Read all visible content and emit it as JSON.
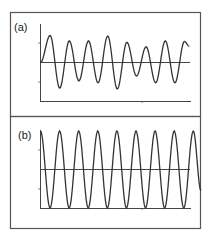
{
  "figure": {
    "panels": [
      {
        "id": "a",
        "label": "(a)"
      },
      {
        "id": "b",
        "label": "(b)"
      }
    ]
  },
  "chart_data": [
    {
      "type": "line",
      "title": "(a)",
      "xlabel": "",
      "ylabel": "",
      "grid": false,
      "description": "Oscillation with varying (modulated) amplitude about a center line",
      "extrema": [
        {
          "x": 0.0,
          "y": 0.0
        },
        {
          "x": 0.5,
          "y": 1.0
        },
        {
          "x": 1.0,
          "y": -0.95
        },
        {
          "x": 1.5,
          "y": 0.8
        },
        {
          "x": 2.0,
          "y": -0.68
        },
        {
          "x": 2.5,
          "y": 0.8
        },
        {
          "x": 3.0,
          "y": -0.75
        },
        {
          "x": 3.5,
          "y": 0.98
        },
        {
          "x": 4.0,
          "y": -0.98
        },
        {
          "x": 4.5,
          "y": 0.75
        },
        {
          "x": 5.0,
          "y": -0.5
        },
        {
          "x": 5.5,
          "y": 0.58
        },
        {
          "x": 6.0,
          "y": -0.75
        },
        {
          "x": 6.5,
          "y": 0.8
        },
        {
          "x": 7.0,
          "y": -0.75
        },
        {
          "x": 7.5,
          "y": 0.78
        },
        {
          "x": 7.75,
          "y": 0.6
        }
      ],
      "ylim": [
        -1.2,
        1.2
      ]
    },
    {
      "type": "line",
      "title": "(b)",
      "xlabel": "",
      "ylabel": "",
      "grid": false,
      "description": "Constant-amplitude sinusoidal oscillation",
      "extrema": [
        {
          "x": 0.0,
          "y": 1.0
        },
        {
          "x": 0.5,
          "y": -1.0
        },
        {
          "x": 1.0,
          "y": 1.0
        },
        {
          "x": 1.5,
          "y": -1.0
        },
        {
          "x": 2.0,
          "y": 1.0
        },
        {
          "x": 2.5,
          "y": -1.0
        },
        {
          "x": 3.0,
          "y": 1.0
        },
        {
          "x": 3.5,
          "y": -1.0
        },
        {
          "x": 4.0,
          "y": 1.0
        },
        {
          "x": 4.5,
          "y": -1.0
        },
        {
          "x": 5.0,
          "y": 1.0
        },
        {
          "x": 5.5,
          "y": -1.0
        },
        {
          "x": 6.0,
          "y": 1.0
        },
        {
          "x": 6.5,
          "y": -1.0
        },
        {
          "x": 7.0,
          "y": 1.0
        },
        {
          "x": 7.5,
          "y": -1.0
        },
        {
          "x": 8.0,
          "y": 1.0
        },
        {
          "x": 8.4,
          "y": -0.55
        }
      ],
      "ylim": [
        -1.0,
        1.0
      ]
    }
  ]
}
